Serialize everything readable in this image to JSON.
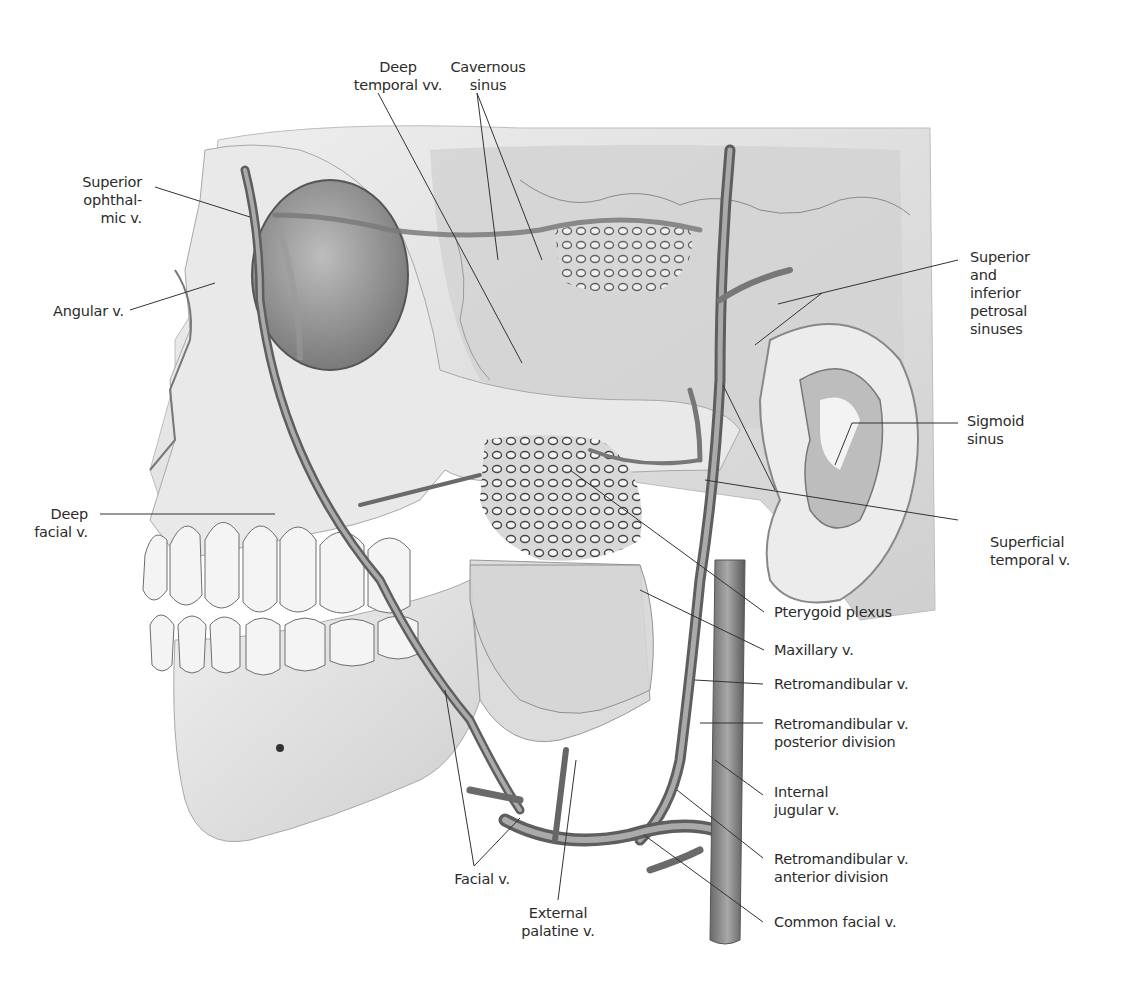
{
  "figure": {
    "colors": {
      "background": "#ffffff",
      "bone": "#e4e4e4",
      "bone_shadow": "#9a9a9a",
      "vein": "#8a8a8a",
      "vein_dark": "#5e5e5e",
      "leader": "#333333",
      "text": "#2b2b2b"
    }
  },
  "labels": {
    "deep_temporal": "Deep\ntemporal vv.",
    "cavernous_sinus": "Cavernous\nsinus",
    "superior_ophthalmic": "Superior\nophthal-\nmic v.",
    "angular": "Angular v.",
    "superior_inferior_petrosal": "Superior\nand\ninferior\npetrosal\nsinuses",
    "sigmoid_sinus": "Sigmoid\nsinus",
    "deep_facial": "Deep\nfacial v.",
    "superficial_temporal": "Superficial\ntemporal v.",
    "pterygoid_plexus": "Pterygoid plexus",
    "maxillary": "Maxillary v.",
    "retromandibular": "Retromandibular v.",
    "retromandibular_posterior": "Retromandibular v.\nposterior division",
    "internal_jugular": "Internal\njugular v.",
    "retromandibular_anterior": "Retromandibular v.\nanterior division",
    "common_facial": "Common facial v.",
    "facial": "Facial v.",
    "external_palatine": "External\npalatine v."
  }
}
